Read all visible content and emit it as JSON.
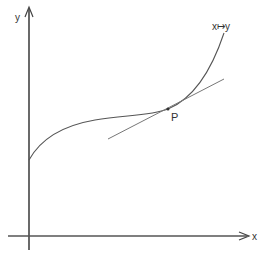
{
  "diagram": {
    "type": "function-graph-with-tangent",
    "axes": {
      "x_label": "x",
      "y_label": "y"
    },
    "curve": {
      "label": "x↦y",
      "description": "increasing curve with inflection point at P"
    },
    "point": {
      "label": "P"
    },
    "tangent": {
      "description": "tangent line to curve at P"
    },
    "colors": {
      "axis": "#444444",
      "curve": "#555555",
      "tangent": "#777777",
      "text": "#333333"
    }
  }
}
